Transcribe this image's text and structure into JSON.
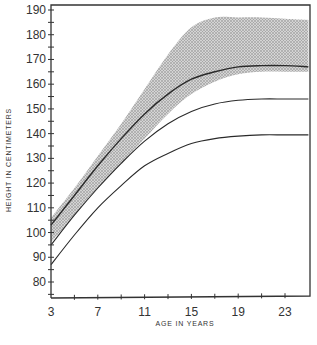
{
  "chart_data": {
    "type": "line",
    "title": "",
    "xlabel": "Age in years",
    "ylabel": "Height in centimeters",
    "xlim": [
      3,
      25
    ],
    "ylim": [
      74,
      191
    ],
    "grid": false,
    "legend": null,
    "x_ticks": [
      3,
      7,
      11,
      15,
      19,
      23
    ],
    "y_ticks": [
      80,
      90,
      100,
      110,
      120,
      130,
      140,
      150,
      160,
      170,
      180,
      190
    ],
    "x": [
      3,
      5,
      7,
      9,
      11,
      13,
      15,
      17,
      19,
      21,
      23,
      25
    ],
    "series": [
      {
        "name": "upper curve",
        "values": [
          103,
          115,
          127,
          138,
          148,
          156,
          162,
          165,
          167,
          167.5,
          167.5,
          167
        ]
      },
      {
        "name": "middle curve",
        "values": [
          95,
          107,
          118,
          128,
          137,
          144,
          149,
          152,
          153.5,
          154,
          154,
          154
        ]
      },
      {
        "name": "lower curve",
        "values": [
          87,
          99,
          110,
          119,
          127,
          132,
          136,
          138,
          139,
          139.5,
          139.5,
          139.5
        ]
      }
    ],
    "shaded_band": {
      "name": "shaded range",
      "upper": [
        106,
        118,
        131,
        144,
        158,
        172,
        183,
        187,
        187,
        187,
        186.5,
        186
      ],
      "lower": [
        96,
        107,
        118,
        128,
        138,
        148,
        156,
        161,
        164,
        165,
        165,
        165
      ]
    }
  },
  "axes": {
    "x_title": "Age in years",
    "y_title": "Height in centimeters",
    "x_tick_labels": [
      "3",
      "7",
      "11",
      "15",
      "19",
      "23"
    ],
    "y_tick_labels": [
      "80",
      "90",
      "100",
      "110",
      "120",
      "130",
      "140",
      "150",
      "160",
      "170",
      "180",
      "190"
    ]
  },
  "colors": {
    "line": "#2a2a2a",
    "band": "#b8b8b8",
    "axis": "#333333"
  }
}
